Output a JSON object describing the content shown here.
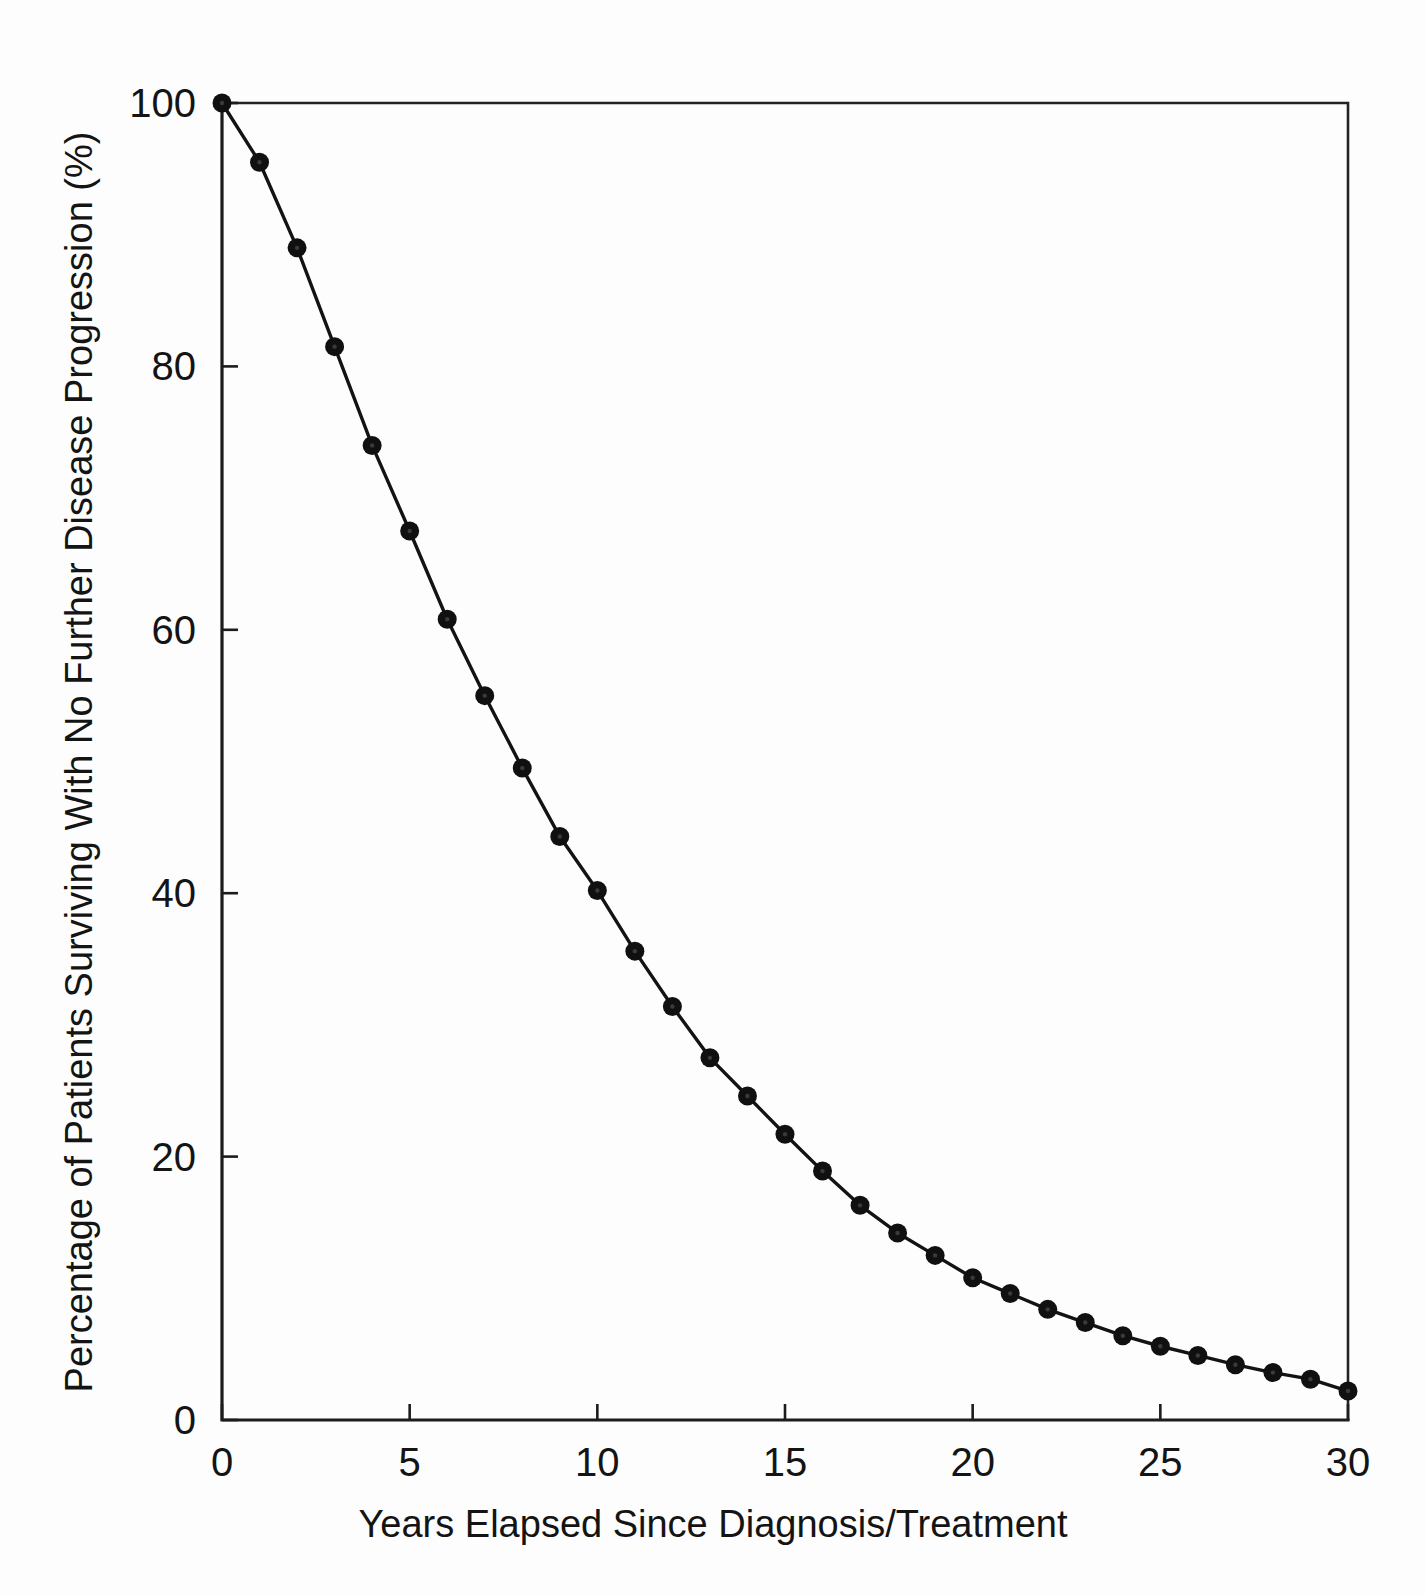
{
  "figure": {
    "background_color": "#fdfdfd",
    "ink_color": "#141414"
  },
  "chart_data": {
    "type": "line",
    "title": "",
    "subtitle": "",
    "xlabel": "Years Elapsed Since Diagnosis/Treatment",
    "ylabel": "Percentage of Patients Surviving With No Further Disease Progression (%)",
    "xlim": [
      0,
      30
    ],
    "ylim": [
      0,
      100
    ],
    "xticks": [
      0,
      5,
      10,
      15,
      20,
      25,
      30
    ],
    "xtick_labels": [
      "0",
      "5",
      "10",
      "15",
      "20",
      "25",
      "30"
    ],
    "yticks": [
      0,
      20,
      40,
      60,
      80,
      100
    ],
    "ytick_labels": [
      "0",
      "20",
      "40",
      "60",
      "80",
      "100"
    ],
    "grid": false,
    "legend": false,
    "legend_position": "none",
    "marker": "filled-circle",
    "line_color": "#131313",
    "marker_color": "#101010",
    "x": [
      0,
      1,
      2,
      3,
      4,
      5,
      6,
      7,
      8,
      9,
      10,
      11,
      12,
      13,
      14,
      15,
      16,
      17,
      18,
      19,
      20,
      21,
      22,
      23,
      24,
      25,
      26,
      27,
      28,
      29,
      30
    ],
    "values": [
      100,
      95.5,
      89,
      81.5,
      74,
      67.5,
      60.8,
      55,
      49.5,
      44.3,
      40.2,
      35.6,
      31.4,
      27.5,
      24.6,
      21.7,
      18.9,
      16.3,
      14.2,
      12.5,
      10.8,
      9.6,
      8.4,
      7.4,
      6.4,
      5.6,
      4.9,
      4.2,
      3.6,
      3.1,
      2.2
    ],
    "series": [
      {
        "name": "Progression-free survival",
        "values": [
          100,
          95.5,
          89,
          81.5,
          74,
          67.5,
          60.8,
          55,
          49.5,
          44.3,
          40.2,
          35.6,
          31.4,
          27.5,
          24.6,
          21.7,
          18.9,
          16.3,
          14.2,
          12.5,
          10.8,
          9.6,
          8.4,
          7.4,
          6.4,
          5.6,
          4.9,
          4.2,
          3.6,
          3.1,
          2.2
        ]
      }
    ]
  }
}
